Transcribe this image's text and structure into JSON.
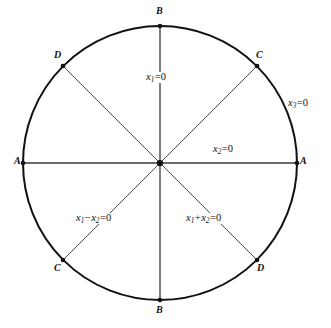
{
  "figure": {
    "type": "geometric-diagram",
    "width": 331,
    "height": 328,
    "background_color": "#ffffff",
    "stroke_color": "#111111",
    "circle": {
      "center_x": 160,
      "center_y": 163,
      "radius": 137,
      "stroke_width": 2.0,
      "label": "x3=0"
    },
    "diameters": [
      {
        "name": "vertical",
        "angle_deg": 90,
        "stroke_width": 1.2,
        "endpoints": [
          "B-top",
          "B-bottom"
        ],
        "equation": "x1=0"
      },
      {
        "name": "horizontal",
        "angle_deg": 0,
        "stroke_width": 1.2,
        "endpoints": [
          "A-left",
          "A-right"
        ],
        "equation": "x2=0"
      },
      {
        "name": "diagonal-nw-se",
        "angle_deg": 135,
        "stroke_width": 1.0,
        "endpoints": [
          "D-upper-left",
          "D-lower-right"
        ],
        "equation": "x1+x2=0"
      },
      {
        "name": "diagonal-ne-sw",
        "angle_deg": 45,
        "stroke_width": 1.0,
        "endpoints": [
          "C-upper-right",
          "C-lower-left"
        ],
        "equation": "x1-x2=0"
      }
    ],
    "vertices": [
      {
        "id": "b-top",
        "label": "B",
        "angle_deg": 90,
        "x": 160,
        "y": 12
      },
      {
        "id": "c-upper-right",
        "label": "C",
        "angle_deg": 45,
        "x": 259,
        "y": 57
      },
      {
        "id": "a-right",
        "label": "A",
        "angle_deg": 0,
        "x": 302,
        "y": 163
      },
      {
        "id": "d-lower-right",
        "label": "D",
        "angle_deg": -45,
        "x": 261,
        "y": 270
      },
      {
        "id": "b-bottom",
        "label": "B",
        "angle_deg": -90,
        "x": 160,
        "y": 313
      },
      {
        "id": "c-lower-left",
        "label": "C",
        "angle_deg": -135,
        "x": 57,
        "y": 270
      },
      {
        "id": "a-left",
        "label": "A",
        "angle_deg": 180,
        "x": 17,
        "y": 163
      },
      {
        "id": "d-upper-left",
        "label": "D",
        "angle_deg": 135,
        "x": 56,
        "y": 57
      }
    ],
    "equation_labels": [
      {
        "id": "eq-x1",
        "text": "x1 = 0",
        "variable": "x",
        "sub": "1",
        "rhs": "0",
        "x": 146,
        "y": 73
      },
      {
        "id": "eq-x2",
        "text": "x2 = 0",
        "variable": "x",
        "sub": "2",
        "rhs": "0",
        "x": 213,
        "y": 145
      },
      {
        "id": "eq-x3",
        "text": "x3 = 0",
        "variable": "x",
        "sub": "3",
        "rhs": "0",
        "x": 288,
        "y": 99
      },
      {
        "id": "eq-x1-minus-x2",
        "text": "x1 - x2 = 0",
        "x": 76,
        "y": 214
      },
      {
        "id": "eq-x1-plus-x2",
        "text": "x1 + x2 = 0",
        "x": 186,
        "y": 214
      }
    ],
    "symbols": {
      "minus": "−",
      "plus": "+",
      "equals": "=",
      "zero": "0",
      "x": "x",
      "sub1": "1",
      "sub2": "2",
      "sub3": "3"
    }
  }
}
